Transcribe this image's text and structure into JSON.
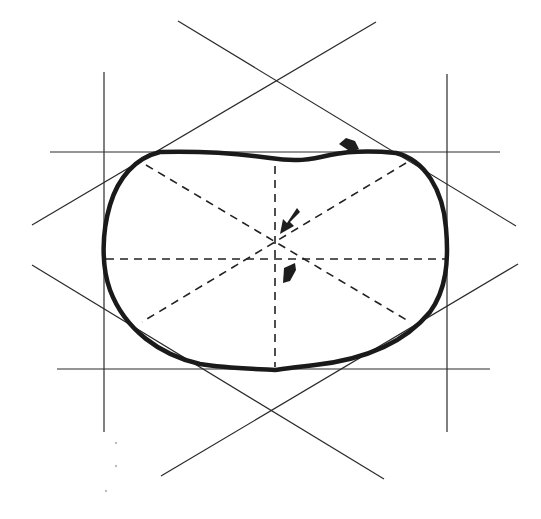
{
  "diagram": {
    "title": "",
    "colors": {
      "background": "#ffffff",
      "ink": "#1a1a1a",
      "construction": "#2a2a2a"
    },
    "bounding_lines": {
      "vertical": [
        {
          "x": 104,
          "y1": 72,
          "y2": 432
        },
        {
          "x": 447,
          "y1": 74,
          "y2": 432
        }
      ],
      "horizontal": [
        {
          "y": 152,
          "x1": 50,
          "x2": 500
        },
        {
          "y": 369,
          "x1": 57,
          "x2": 490
        }
      ]
    },
    "tangent_lines": [
      {
        "x1": 178,
        "y1": 21,
        "x2": 516,
        "y2": 226
      },
      {
        "x1": 376,
        "y1": 22,
        "x2": 32,
        "y2": 225
      },
      {
        "x1": 32,
        "y1": 265,
        "x2": 384,
        "y2": 479
      },
      {
        "x1": 518,
        "y1": 264,
        "x2": 161,
        "y2": 476
      }
    ],
    "center": {
      "x": 275,
      "y": 243
    },
    "dashed_axes": [
      {
        "x1": 104,
        "y1": 259,
        "x2": 447,
        "y2": 259
      },
      {
        "x1": 275,
        "y1": 165,
        "x2": 275,
        "y2": 369
      },
      {
        "x1": 146,
        "y1": 164,
        "x2": 410,
        "y2": 322
      },
      {
        "x1": 406,
        "y1": 163,
        "x2": 142,
        "y2": 322
      }
    ],
    "arrows": [
      {
        "name": "top-indent-arrow",
        "x": 348,
        "y": 146,
        "direction": "down-right"
      },
      {
        "name": "center-upper-arrow",
        "x": 285,
        "y": 226,
        "direction": "down-left"
      },
      {
        "name": "center-lower-arrow",
        "x": 290,
        "y": 272,
        "direction": "up"
      }
    ]
  }
}
